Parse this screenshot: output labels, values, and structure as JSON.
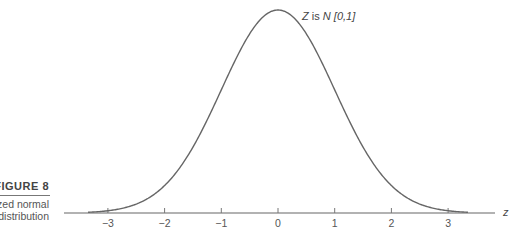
{
  "figure": {
    "label": "FIGURE 8",
    "caption_line1": "zed normal",
    "caption_line2": "distribution"
  },
  "chart_data": {
    "type": "line",
    "title": "",
    "annotation": "Z is N [0,1]",
    "annotation_parts": {
      "var": "Z",
      "is": "is",
      "dist": "N",
      "params": "[0,1]"
    },
    "xlabel": "z",
    "ylabel": "",
    "x_ticks": [
      -3,
      -2,
      -1,
      0,
      1,
      2,
      3
    ],
    "x_tick_labels": [
      "−3",
      "−2",
      "−1",
      "0",
      "1",
      "2",
      "3"
    ],
    "xlim": [
      -3.8,
      3.8
    ],
    "curve_range": [
      -3.35,
      3.35
    ],
    "series": [
      {
        "name": "standard normal pdf",
        "mean": 0,
        "sd": 1,
        "x": [
          -3,
          -2,
          -1,
          0,
          1,
          2,
          3
        ],
        "y": [
          0.0044,
          0.054,
          0.242,
          0.399,
          0.242,
          0.054,
          0.0044
        ]
      }
    ],
    "grid": false,
    "legend": "none"
  }
}
